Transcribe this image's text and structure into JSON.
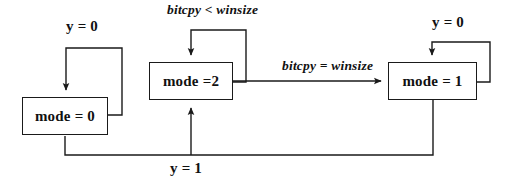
{
  "diagram": {
    "type": "state-transition-diagram",
    "background_color": "#ffffff",
    "line_color": "#1a1a1a",
    "text_color": "#111111",
    "states": [
      {
        "id": "state-mode-0",
        "label": "mode = 0",
        "x": 22,
        "y": 97,
        "width": 86,
        "height": 38
      },
      {
        "id": "state-mode-2",
        "label": "mode =2",
        "x": 149,
        "y": 62,
        "width": 84,
        "height": 38
      },
      {
        "id": "state-mode-1",
        "label": "mode = 1",
        "x": 388,
        "y": 62,
        "width": 89,
        "height": 38
      }
    ],
    "transitions": [
      {
        "id": "self-loop-mode-0",
        "label": "y = 0",
        "from": "state-mode-0",
        "to": "state-mode-0",
        "style": "upright",
        "label_x": 66,
        "label_y": 18
      },
      {
        "id": "self-loop-mode-2",
        "label": "bitcpy < winsize",
        "from": "state-mode-2",
        "to": "state-mode-2",
        "style": "italic",
        "label_x": 167,
        "label_y": 2
      },
      {
        "id": "self-loop-mode-1",
        "label": "y = 0",
        "from": "state-mode-1",
        "to": "state-mode-1",
        "style": "upright",
        "label_x": 432,
        "label_y": 14
      },
      {
        "id": "transition-mode-2-to-mode-1",
        "label": "bitcpy = winsize",
        "from": "state-mode-2",
        "to": "state-mode-1",
        "style": "italic",
        "label_x": 282,
        "label_y": 58
      },
      {
        "id": "transition-feedback-y1",
        "label": "y = 1",
        "from": "state-mode-1",
        "to": "state-mode-2",
        "style": "upright",
        "label_x": 170,
        "label_y": 160
      }
    ]
  }
}
